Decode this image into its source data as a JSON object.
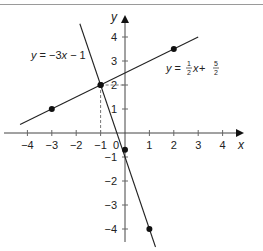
{
  "chart_data": {
    "type": "line",
    "title": "",
    "xlabel": "x",
    "ylabel": "y",
    "xlim": [
      -4.5,
      4.8
    ],
    "ylim": [
      -4.8,
      4.8
    ],
    "x_ticks": [
      -4,
      -3,
      -2,
      -1,
      0,
      1,
      2,
      3,
      4
    ],
    "y_ticks": [
      -4,
      -3,
      -2,
      -1,
      1,
      2,
      3,
      4
    ],
    "grid": false,
    "series": [
      {
        "name": "y = 1/2 x + 5/2",
        "label_text": "y = ½x + 5/2",
        "slope": 0.5,
        "intercept": 2.5,
        "x_range": [
          -4.3,
          3.0
        ],
        "points": [
          [
            -3,
            1
          ],
          [
            -1,
            2
          ],
          [
            2,
            3.5
          ]
        ]
      },
      {
        "name": "y = -3x - 1",
        "label_text": "y = −3x − 1",
        "slope": -3,
        "intercept": -1,
        "x_range": [
          -1.85,
          1.25
        ],
        "points": [
          [
            -1,
            2
          ],
          [
            0,
            -0.7
          ],
          [
            1,
            -4
          ]
        ]
      }
    ],
    "annotations": [
      {
        "type": "dashed-vertical",
        "from": [
          -1,
          2
        ],
        "to": [
          -1,
          0
        ]
      },
      {
        "type": "dashed-horizontal",
        "from": [
          -1,
          2
        ],
        "to": [
          0,
          2
        ]
      },
      {
        "type": "intersection",
        "point": [
          -1,
          2
        ]
      }
    ]
  },
  "labels": {
    "x_axis": "x",
    "y_axis": "y",
    "origin": "0",
    "eq1_y": "y",
    "eq1_rest": " = −3",
    "eq1_x": "x",
    "eq1_tail": " − 1",
    "eq2_y": "y",
    "eq2_eq": " = ",
    "eq2_num1": "1",
    "eq2_den1": "2",
    "eq2_x": "x",
    "eq2_plus": " + ",
    "eq2_num2": "5",
    "eq2_den2": "2"
  }
}
